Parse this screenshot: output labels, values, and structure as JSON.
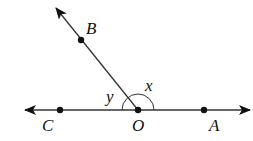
{
  "diagram": {
    "type": "geometry-angles",
    "points": {
      "B": {
        "label": "B"
      },
      "O": {
        "label": "O"
      },
      "C": {
        "label": "C"
      },
      "A": {
        "label": "A"
      }
    },
    "angles": {
      "x": {
        "label": "x"
      },
      "y": {
        "label": "y"
      }
    },
    "colors": {
      "stroke": "#222222",
      "background": "#ffffff"
    }
  }
}
